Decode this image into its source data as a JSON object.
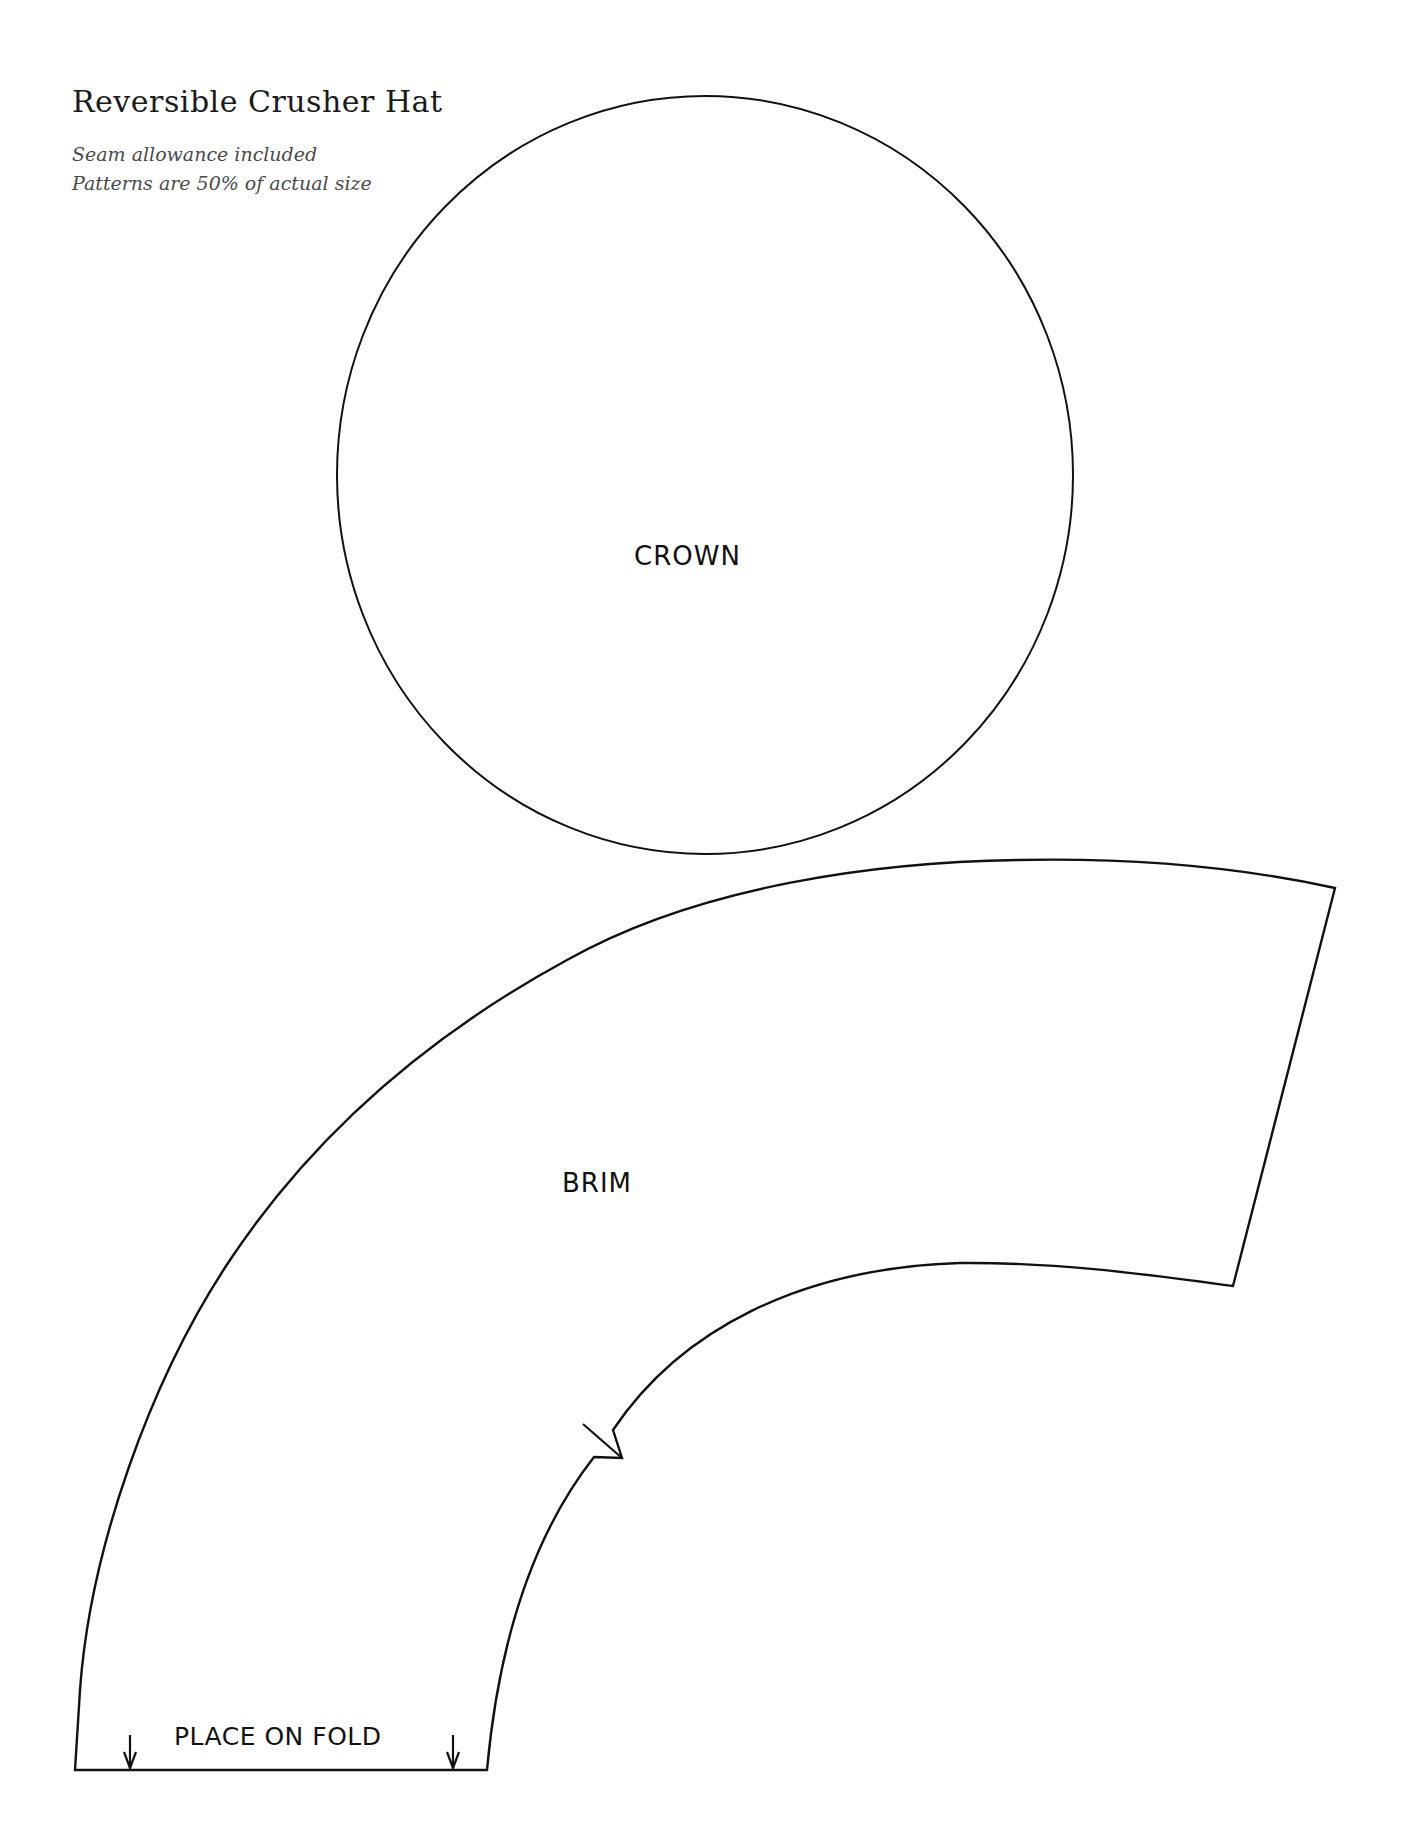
{
  "header": {
    "title": "Reversible Crusher Hat",
    "notes": [
      "Seam allowance included",
      "Patterns are 50% of actual size"
    ]
  },
  "pieces": {
    "crown": {
      "label": "CROWN",
      "shape": "circle"
    },
    "brim": {
      "label": "BRIM",
      "shape": "curved-band",
      "fold_label": "PLACE ON FOLD",
      "markings": [
        "notch",
        "fold-arrow-left",
        "fold-arrow-right"
      ]
    }
  },
  "colors": {
    "line": "#111111",
    "background": "#ffffff",
    "note_text": "#4a4a4a"
  }
}
